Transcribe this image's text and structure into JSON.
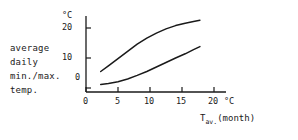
{
  "figure": {
    "background_color": "#ffffff",
    "line_color": "#1a1a1a",
    "axis_color": "#1a1a1a"
  },
  "side_label": {
    "line1": "average",
    "line2": "daily",
    "line3": "min./max.",
    "line4": "temp."
  },
  "y_axis": {
    "unit": "°C",
    "tick_labels": [
      "0",
      "10",
      "20"
    ]
  },
  "x_axis": {
    "unit": "°C",
    "tick_labels": [
      "0",
      "5",
      "10",
      "15",
      "20"
    ],
    "title_main": "T",
    "title_sub": "av.",
    "title_tail": "(month)"
  },
  "chart_data": {
    "type": "line",
    "title": "",
    "xlabel": "T av. (month)",
    "ylabel": "average daily min./max. temp.",
    "x_unit": "°C",
    "y_unit": "°C",
    "xlim": [
      0,
      21.7
    ],
    "ylim": [
      -1.3,
      24.7
    ],
    "xticks": [
      0,
      5,
      10,
      15,
      20
    ],
    "yticks": [
      0,
      10,
      20
    ],
    "grid": false,
    "legend": "none",
    "series": [
      {
        "name": "average daily max. temp.",
        "x": [
          2.3,
          3.5,
          5.0,
          6.5,
          8.0,
          9.5,
          11.0,
          12.5,
          14.0,
          15.5,
          16.8,
          17.8
        ],
        "y": [
          5.5,
          7.4,
          9.8,
          12.2,
          14.6,
          16.6,
          18.3,
          19.7,
          20.8,
          21.6,
          22.2,
          22.6
        ]
      },
      {
        "name": "average daily min. temp.",
        "x": [
          2.3,
          3.5,
          5.0,
          6.5,
          8.0,
          9.5,
          11.0,
          12.5,
          14.0,
          15.5,
          16.8,
          17.8
        ],
        "y": [
          1.2,
          1.5,
          2.1,
          3.0,
          4.2,
          5.5,
          7.0,
          8.5,
          10.0,
          11.4,
          12.8,
          13.8
        ]
      }
    ]
  }
}
